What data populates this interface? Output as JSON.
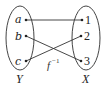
{
  "diagram": {
    "function_label": "f",
    "function_superscript": "−1",
    "domain_set": {
      "name": "Y",
      "elements": [
        "a",
        "b",
        "c"
      ]
    },
    "codomain_set": {
      "name": "X",
      "elements": [
        "1",
        "2",
        "3"
      ]
    },
    "mappings": [
      {
        "from": "a",
        "to": "1"
      },
      {
        "from": "b",
        "to": "3"
      },
      {
        "from": "c",
        "to": "2"
      }
    ],
    "colors": {
      "stroke": "#333333",
      "background": "#ffffff"
    }
  }
}
